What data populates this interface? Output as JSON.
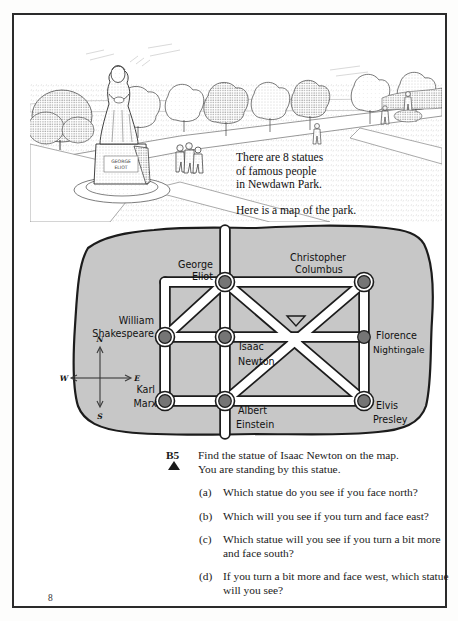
{
  "page": {
    "number": "8"
  },
  "illustration": {
    "name": "park-scene-engraving",
    "statue_plinth_text": "GEORGE ELIOT",
    "alt": "Engraving of a park with a statue of a woman on a plinth, trees and people walking on paths"
  },
  "intro": {
    "line1": "There are 8 statues",
    "line2": "of famous people",
    "line3": "in Newdawn Park.",
    "line4": "Here is a map of the park."
  },
  "map": {
    "title": "Map of Newdawn Park",
    "fill_color": "#c7c7c7",
    "outline_color": "#1c1c1c",
    "path_color": "#ffffff",
    "node_color": "#777777",
    "statues": [
      {
        "id": "george-eliot",
        "name": "George Eliot",
        "label_line1": "George",
        "label_line2": "Eliot",
        "x": 183,
        "y": 62,
        "ring": true
      },
      {
        "id": "christopher-columbus",
        "name": "Christopher Columbus",
        "label_line1": "Christopher",
        "label_line2": "Columbus",
        "x": 322,
        "y": 62,
        "ring": true
      },
      {
        "id": "william-shakespeare",
        "name": "William Shakespeare",
        "label_line1": "William",
        "label_line2": "Shakespeare",
        "x": 123,
        "y": 117,
        "ring": true
      },
      {
        "id": "isaac-newton",
        "name": "Isaac Newton",
        "label_line1": "Isaac",
        "label_line2": "Newton",
        "x": 183,
        "y": 117,
        "ring": true
      },
      {
        "id": "florence-nightingale",
        "name": "Florence Nightingale",
        "label_line1": "Florence",
        "label_line2": "Nightingale",
        "x": 322,
        "y": 117,
        "ring": false
      },
      {
        "id": "karl-marx",
        "name": "Karl Marx",
        "label_line1": "Karl",
        "label_line2": "Marx",
        "x": 123,
        "y": 181,
        "ring": true
      },
      {
        "id": "albert-einstein",
        "name": "Albert Einstein",
        "label_line1": "Albert",
        "label_line2": "Einstein",
        "x": 183,
        "y": 181,
        "ring": true
      },
      {
        "id": "elvis-presley",
        "name": "Elvis Presley",
        "label_line1": "Elvis",
        "label_line2": "Presley",
        "x": 322,
        "y": 181,
        "ring": true
      }
    ],
    "compass": {
      "north": "N",
      "south": "S",
      "east": "E",
      "west": "W"
    }
  },
  "question": {
    "tag": "B5",
    "bullet": "triangle",
    "stem_line1": "Find the statue of Isaac Newton on the map.",
    "stem_line2": "You are standing by this statue.",
    "parts": [
      {
        "label": "(a)",
        "text": "Which statue do you see if you face north?"
      },
      {
        "label": "(b)",
        "text": "Which will you see if you turn and face east?"
      },
      {
        "label": "(c)",
        "text": "Which statue will you see if you turn a bit more and face south?"
      },
      {
        "label": "(d)",
        "text": "If you turn a bit more and face west, which statue will you see?"
      }
    ]
  }
}
